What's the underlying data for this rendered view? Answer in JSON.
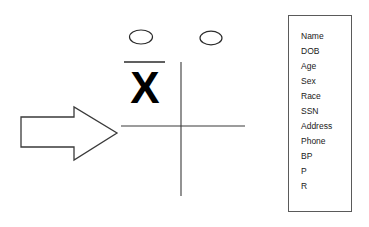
{
  "diagram": {
    "background_color": "#ffffff",
    "ink_color": "#000000",
    "arrow": {
      "label": "right-arrow",
      "direction": "right",
      "fill": "#ffffff",
      "stroke": "#3a3a3a"
    },
    "figure": {
      "label": "quadrant-cross-figure",
      "stroke": "#3a3a3a",
      "ovals": [
        {
          "name": "oval-left",
          "label": ""
        },
        {
          "name": "oval-right",
          "label": ""
        }
      ],
      "overbar": {
        "name": "overbar",
        "label": ""
      },
      "x_mark": {
        "name": "x-mark",
        "label": "X"
      },
      "horizontal_line": {
        "name": "horizontal-axis",
        "label": ""
      },
      "vertical_line": {
        "name": "vertical-axis",
        "label": ""
      }
    },
    "field_list": {
      "name": "patient-field-list",
      "border_color": "#5a5a5a",
      "items": [
        {
          "label": "Name"
        },
        {
          "label": "DOB"
        },
        {
          "label": "Age"
        },
        {
          "label": "Sex"
        },
        {
          "label": "Race"
        },
        {
          "label": "SSN"
        },
        {
          "label": "Address"
        },
        {
          "label": "Phone"
        },
        {
          "label": "BP"
        },
        {
          "label": "P"
        },
        {
          "label": "R"
        }
      ]
    }
  }
}
